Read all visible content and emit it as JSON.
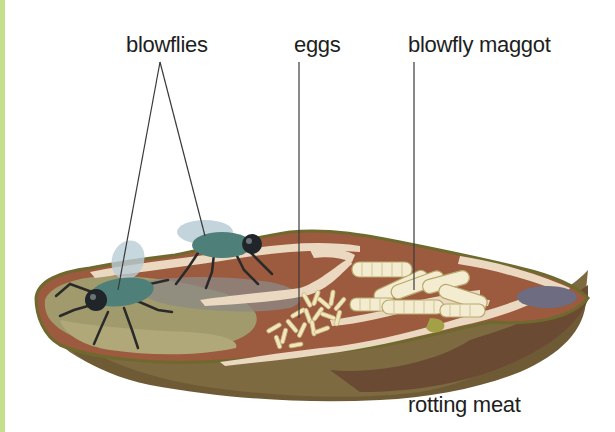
{
  "diagram": {
    "labels": {
      "blowflies": "blowflies",
      "eggs": "eggs",
      "maggot": "blowfly maggot",
      "meat": "rotting meat"
    },
    "colors": {
      "edge_strip": "#c5e08c",
      "meat_dark": "#7a5a3a",
      "meat_side": "#8a6a44",
      "meat_red": "#9c5a3e",
      "fat": "#ead8c0",
      "mold": "#9a9468",
      "rim": "#6e6a2e",
      "fly_body": "#4e7f78",
      "fly_wing": "#b9cdd6",
      "egg": "#f1e7bd",
      "maggot": "#f3ecd0",
      "bruise": "#6d6c80",
      "leader_line": "#3a3a3a"
    }
  }
}
